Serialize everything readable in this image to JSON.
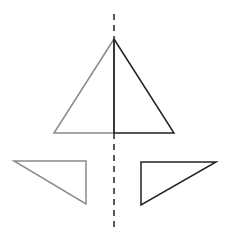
{
  "diagram": {
    "colors": {
      "background": "#ffffff",
      "light_stroke": "#8a8a8a",
      "dark_stroke": "#222222",
      "axis": "#222222"
    },
    "axis": {
      "x": 114,
      "y1": 14,
      "y2": 228,
      "dash": "6,5"
    },
    "big_triangle": {
      "apex": [
        114,
        39
      ],
      "base_left": [
        54,
        133
      ],
      "base_right": [
        174,
        133
      ],
      "mid_base": [
        114,
        133
      ]
    },
    "left_small_triangle": {
      "points": [
        [
          14,
          161
        ],
        [
          86,
          161
        ],
        [
          86,
          204
        ]
      ]
    },
    "right_small_triangle": {
      "points": [
        [
          141,
          162
        ],
        [
          216,
          162
        ],
        [
          141,
          205
        ]
      ]
    }
  }
}
